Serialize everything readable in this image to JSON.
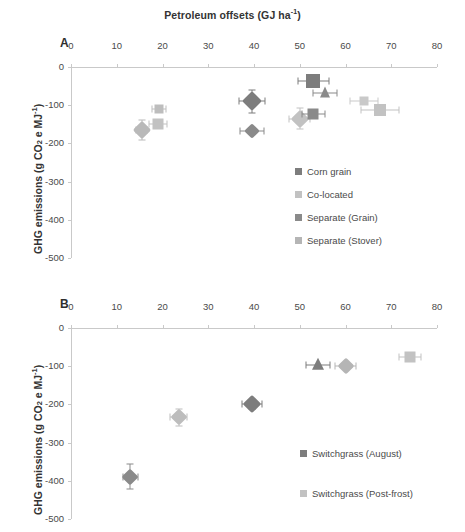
{
  "figure": {
    "title": "Petroleum offsets (GJ ha",
    "title_sup": "-1",
    "title_tail": ")",
    "panel_a_letter": "A",
    "panel_b_letter": "B",
    "ytitle_head": "GHG emissions (g CO",
    "ytitle_sub": "2",
    "ytitle_mid": " e MJ",
    "ytitle_sup": "-1",
    "ytitle_tail": ")"
  },
  "colors": {
    "dark_gray": "#7d7d7d",
    "light_gray": "#c2c2c2",
    "mid_gray": "#9a9a9a",
    "axis": "#c9c9c9",
    "text": "#4a4a4a"
  },
  "chart_data": [
    {
      "type": "scatter",
      "panel": "A",
      "title": "Petroleum offsets (GJ ha-1)",
      "xlabel": "Petroleum offsets (GJ ha-1)",
      "ylabel": "GHG emissions (g CO2 e MJ-1)",
      "xlim": [
        0,
        80
      ],
      "ylim": [
        -500,
        0
      ],
      "xticks": [
        0,
        10,
        20,
        30,
        40,
        50,
        60,
        70,
        80
      ],
      "yticks": [
        0,
        -100,
        -200,
        -300,
        -400,
        -500
      ],
      "xtick_labels": [
        "0",
        "10",
        "20",
        "30",
        "40",
        "50",
        "60",
        "70",
        "80"
      ],
      "ytick_labels": [
        "0",
        "-100",
        "-200",
        "-300",
        "-400",
        "-500"
      ],
      "grid": false,
      "legend_position": "inside-right",
      "legend": [
        {
          "label": "Corn grain",
          "color": "#7d7d7d",
          "marker": "square"
        },
        {
          "label": "Co-located",
          "color": "#c2c2c2",
          "marker": "square"
        },
        {
          "label": "Separate (Grain)",
          "color": "#8a8a8a",
          "marker": "square"
        },
        {
          "label": "Separate (Stover)",
          "color": "#b5b5b5",
          "marker": "square"
        }
      ],
      "points": [
        {
          "series": "Co-located",
          "x": 15.5,
          "y": -165,
          "xerr": 1.2,
          "yerr": 27,
          "marker": "diamond",
          "color": "#b9b9b9",
          "size": 13
        },
        {
          "series": "Separate (Stover)",
          "x": 19.2,
          "y": -110,
          "xerr": 1.6,
          "yerr": 9,
          "marker": "square",
          "color": "#bdbdbd",
          "size": 9
        },
        {
          "series": "Separate (Stover)",
          "x": 19.0,
          "y": -150,
          "xerr": 2.0,
          "yerr": 7,
          "marker": "square",
          "color": "#c2c2c2",
          "size": 11
        },
        {
          "series": "Corn grain",
          "x": 39.5,
          "y": -90,
          "xerr": 2.8,
          "yerr": 30,
          "marker": "diamond",
          "color": "#7d7d7d",
          "size": 14
        },
        {
          "series": "Corn grain",
          "x": 39.6,
          "y": -167,
          "xerr": 2.6,
          "yerr": 6,
          "marker": "diamond",
          "color": "#8a8a8a",
          "size": 11
        },
        {
          "series": "Co-located",
          "x": 50.0,
          "y": -135,
          "xerr": 2.3,
          "yerr": 28,
          "marker": "diamond",
          "color": "#c2c2c2",
          "size": 13
        },
        {
          "series": "Separate (Grain)",
          "x": 53.0,
          "y": -122,
          "xerr": 2.6,
          "yerr": 8,
          "marker": "square",
          "color": "#8a8a8a",
          "size": 11
        },
        {
          "series": "Corn grain",
          "x": 53.0,
          "y": -36,
          "xerr": 3.4,
          "yerr": 0,
          "marker": "square",
          "color": "#7d7d7d",
          "size": 14
        },
        {
          "series": "Separate (Grain)",
          "x": 55.5,
          "y": -68,
          "xerr": 2.6,
          "yerr": 0,
          "marker": "triangle",
          "color": "#8a8a8a",
          "size": 11
        },
        {
          "series": "Separate (Stover)",
          "x": 64.0,
          "y": -89,
          "xerr": 3.0,
          "yerr": 0,
          "marker": "square",
          "color": "#c9c9c9",
          "size": 9
        },
        {
          "series": "Separate (Stover)",
          "x": 67.5,
          "y": -112,
          "xerr": 4.2,
          "yerr": 0,
          "marker": "square",
          "color": "#c2c2c2",
          "size": 12
        }
      ]
    },
    {
      "type": "scatter",
      "panel": "B",
      "xlabel": "Petroleum offsets (GJ ha-1)",
      "ylabel": "GHG emissions (g CO2 e MJ-1)",
      "xlim": [
        0,
        80
      ],
      "ylim": [
        -500,
        0
      ],
      "xticks": [
        0,
        10,
        20,
        30,
        40,
        50,
        60,
        70,
        80
      ],
      "yticks": [
        0,
        -100,
        -200,
        -300,
        -400,
        -500
      ],
      "xtick_labels": [
        "0",
        "10",
        "20",
        "30",
        "40",
        "50",
        "60",
        "70",
        "80"
      ],
      "ytick_labels": [
        "0",
        "-100",
        "-200",
        "-300",
        "-400",
        "-500"
      ],
      "grid": false,
      "legend_position": "inside-right",
      "legend": [
        {
          "label": "Switchgrass (August)",
          "color": "#7d7d7d",
          "marker": "square"
        },
        {
          "label": "Switchgrass (Post-frost)",
          "color": "#c2c2c2",
          "marker": "square"
        }
      ],
      "points": [
        {
          "series": "Switchgrass (August)",
          "x": 13.0,
          "y": -389,
          "xerr": 1.6,
          "yerr": 33,
          "marker": "diamond",
          "color": "#8a8a8a",
          "size": 12
        },
        {
          "series": "Switchgrass (Post-frost)",
          "x": 23.5,
          "y": -234,
          "xerr": 1.9,
          "yerr": 22,
          "marker": "diamond",
          "color": "#bdbdbd",
          "size": 12
        },
        {
          "series": "Switchgrass (August)",
          "x": 39.6,
          "y": -200,
          "xerr": 2.2,
          "yerr": 12,
          "marker": "diamond",
          "color": "#7d7d7d",
          "size": 13
        },
        {
          "series": "Switchgrass (August)",
          "x": 54.0,
          "y": -97,
          "xerr": 2.6,
          "yerr": 0,
          "marker": "triangle",
          "color": "#7d7d7d",
          "size": 12
        },
        {
          "series": "Switchgrass (Post-frost)",
          "x": 60.0,
          "y": -99,
          "xerr": 2.2,
          "yerr": 0,
          "marker": "diamond",
          "color": "#b5b5b5",
          "size": 12
        },
        {
          "series": "Switchgrass (Post-frost)",
          "x": 74.0,
          "y": -77,
          "xerr": 2.4,
          "yerr": 0,
          "marker": "square",
          "color": "#c2c2c2",
          "size": 11
        }
      ]
    }
  ]
}
